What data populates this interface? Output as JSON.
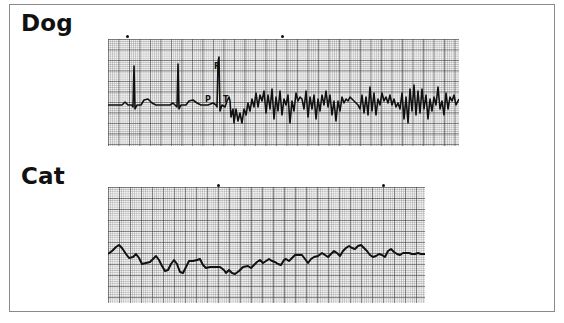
{
  "panels": [
    {
      "label": "Dog",
      "wave_labels": {
        "p": "P",
        "r": "R",
        "t": "T"
      },
      "description": "Sinus complexes followed by a premature complex initiating ventricular fibrillation (coarse)"
    },
    {
      "label": "Cat",
      "description": "Fine, low-amplitude undulating baseline (ventricular fibrillation)"
    }
  ],
  "colors": {
    "trace": "#111111",
    "grid_major": "#555555",
    "grid_minor": "#9a9a9a",
    "paper": "#f3f3f3",
    "frame_border": "#8a8a8a"
  }
}
